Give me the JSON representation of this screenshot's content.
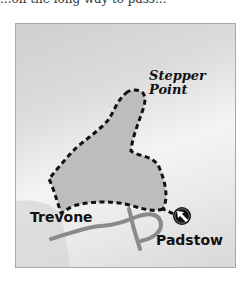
{
  "caption_fragment": "...on the long way to pass...",
  "map": {
    "labels": {
      "headland_line1": "Stepper",
      "headland_line2": "Point",
      "village_west": "Trevone",
      "town_start": "Padstow"
    },
    "icons": {
      "start_marker": "start-arrow-icon"
    },
    "colors": {
      "background": "#e6e6e6",
      "land": "#bdbdbd",
      "route": "#111111",
      "roads": "#8a8a8a",
      "frame": "#a8a8a8"
    }
  }
}
